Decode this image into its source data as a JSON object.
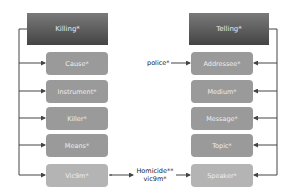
{
  "left_frame": {
    "header": "Killing*",
    "roles": [
      "Cause*",
      "Instrument*",
      "Killer*",
      "Means*",
      "Vic9m*"
    ]
  },
  "right_frame": {
    "header": "Telling*",
    "roles": [
      "Addressee*",
      "Medium*",
      "Message*",
      "Topic*",
      "Speaker*"
    ]
  },
  "annotations": {
    "police": "police*",
    "homicide_line1": "Homicide**",
    "homicide_line2": "vic9m*"
  },
  "colors": {
    "header_top": "#7a7a7a",
    "header_bottom": "#444444",
    "role_box": "#9a9a9a",
    "role_box_highlight": "#b4b4b4",
    "connector": "#444444"
  }
}
